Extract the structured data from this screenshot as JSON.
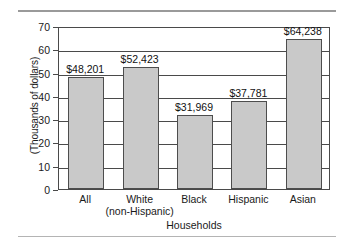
{
  "chart_data": {
    "type": "bar",
    "title": "",
    "subtitle": "",
    "xlabel": "Households",
    "ylabel": "(Thousands of dollars)",
    "categories": [
      "All",
      "White (non-Hispanic)",
      "Black",
      "Hispanic",
      "Asian"
    ],
    "category_lines": [
      [
        "All",
        ""
      ],
      [
        "White",
        "(non-Hispanic)"
      ],
      [
        "Black",
        ""
      ],
      [
        "Hispanic",
        ""
      ],
      [
        "Asian",
        ""
      ]
    ],
    "values": [
      48.201,
      52.423,
      31.969,
      37.781,
      64.238
    ],
    "value_labels": [
      "$48,201",
      "$52,423",
      "$31,969",
      "$37,781",
      "$64,238"
    ],
    "ylim": [
      0,
      70
    ],
    "yticks": [
      70,
      60,
      50,
      40,
      30,
      20,
      10,
      0
    ],
    "ytick_labels": [
      "70",
      "60",
      "50",
      "40",
      "30",
      "20",
      "10",
      "0"
    ],
    "grid": true,
    "legend": "none",
    "bar_fill_color": "#c9c9c9",
    "bar_edge_color": "#4d4d4d",
    "axis_color": "#4a4a4a",
    "rule_color": "#9a9a9a"
  }
}
